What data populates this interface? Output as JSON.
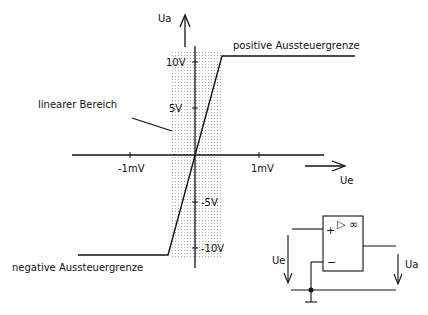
{
  "diagram": {
    "axes": {
      "y_label": "Ua",
      "x_label": "Ue",
      "y_ticks": [
        "10V",
        "5V",
        "-5V",
        "-10V"
      ],
      "x_ticks": [
        "-1mV",
        "1mV"
      ]
    },
    "annotations": {
      "positive_limit": "positive Aussteuergrenze",
      "negative_limit": "negative Aussteuergrenze",
      "linear_region": "linearer Bereich"
    },
    "circuit": {
      "plus": "+",
      "minus": "−",
      "symbol": "▷ ∞",
      "input_label": "Ue",
      "output_label": "Ua"
    },
    "colors": {
      "line": "#111111",
      "shade": "#bdbdbd"
    }
  }
}
